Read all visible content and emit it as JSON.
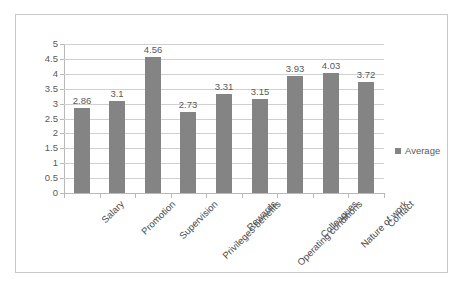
{
  "chart_data": {
    "type": "bar",
    "title": "",
    "xlabel": "",
    "ylabel": "",
    "ylim": [
      0,
      5
    ],
    "ytick_step": 0.5,
    "grid": true,
    "legend_position": "right",
    "categories": [
      "Salary",
      "Promotion",
      "Supervision",
      "Privileges-benefits",
      "Rewards",
      "Operating conditions",
      "Colleagues",
      "Nature of work",
      "Contact"
    ],
    "series": [
      {
        "name": "Average",
        "values": [
          2.86,
          3.1,
          4.56,
          2.73,
          3.31,
          3.15,
          3.93,
          4.03,
          3.72
        ],
        "color": "#848484"
      }
    ],
    "data_labels": [
      "2.86",
      "3.1",
      "4.56",
      "2.73",
      "3.31",
      "3.15",
      "3.93",
      "4.03",
      "3.72"
    ],
    "ytick_labels": [
      "5",
      "4.5",
      "4",
      "3.5",
      "3",
      "2.5",
      "2",
      "1.5",
      "1",
      "0.5",
      "0"
    ]
  },
  "legend": {
    "entries": [
      {
        "label": "Average",
        "swatch": "legend-swatch-icon",
        "color": "#848484"
      }
    ]
  },
  "colors": {
    "bar": "#848484",
    "gridline": "#d0d0d0",
    "axis": "#b8b8b8",
    "frame": "#c9c9c9",
    "text": "#5a5a5a"
  }
}
